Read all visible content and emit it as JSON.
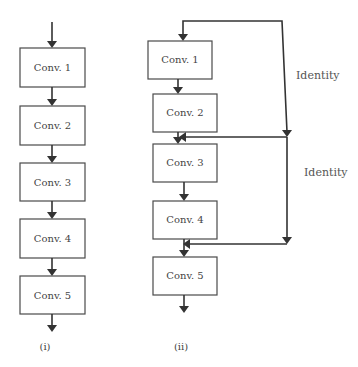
{
  "diagram": {
    "plain": {
      "caption": "(i)",
      "blocks": [
        "Conv. 1",
        "Conv. 2",
        "Conv. 3",
        "Conv. 4",
        "Conv. 5"
      ]
    },
    "residual": {
      "caption": "(ii)",
      "blocks": [
        "Conv. 1",
        "Conv. 2",
        "Conv. 3",
        "Conv. 4",
        "Conv. 5"
      ],
      "skip_labels": [
        "Identity",
        "Identity"
      ]
    }
  }
}
